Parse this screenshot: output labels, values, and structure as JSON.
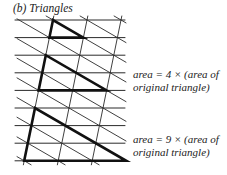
{
  "title": "(b) Triangles",
  "labels": [
    {
      "line1": "area = 4 × (area of",
      "line2": "original triangle)",
      "top": 68
    },
    {
      "line1": "area = 9 × (area of",
      "line2": "original triangle)",
      "top": 133
    }
  ],
  "grid": {
    "rows": 9,
    "row0_y": 20,
    "row_dy": 17.6,
    "col0_x": 53,
    "col_dx": 34,
    "slant_per_row": -3.6,
    "x_min": 15,
    "x_max": 125,
    "line_color": "#2a2a2a"
  },
  "triangles": [
    {
      "name": "original-triangle",
      "top": [
        0,
        0
      ],
      "size": 1
    },
    {
      "name": "triangle-area-4",
      "top": [
        2,
        0
      ],
      "size": 2
    },
    {
      "name": "triangle-area-9",
      "top": [
        5,
        0
      ],
      "size": 3
    }
  ]
}
